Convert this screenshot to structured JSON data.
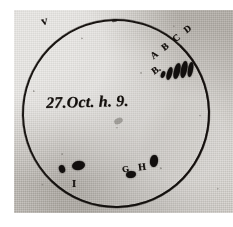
{
  "document": {
    "kind": "scanned-handwritten-sunspot-drawing",
    "paper_color": "#c9c6c0",
    "ink_color": "#15110e",
    "background_color": "#ffffff"
  },
  "disk": {
    "name": "solar-disk-circle",
    "stroke_color": "#1b1714"
  },
  "annotations": {
    "date": "27.Oct. h. 9.",
    "group_abcd": "A B C D",
    "label_b": "B.",
    "label_g": "G",
    "label_h": "H",
    "label_i": "I",
    "stray_mark": "v"
  },
  "spots": [
    {
      "id": "a",
      "group": "ABCD",
      "position": "upper-right"
    },
    {
      "id": "b",
      "group": "ABCD",
      "position": "upper-right"
    },
    {
      "id": "c",
      "group": "ABCD",
      "position": "upper-right"
    },
    {
      "id": "d",
      "group": "ABCD",
      "position": "upper-right"
    },
    {
      "id": "e",
      "group": "ABCD",
      "position": "upper-right"
    },
    {
      "id": "i1",
      "group": "I",
      "position": "lower-left"
    },
    {
      "id": "i2",
      "group": "I",
      "position": "lower-left"
    },
    {
      "id": "g",
      "group": "G",
      "position": "lower-center"
    },
    {
      "id": "h",
      "group": "H",
      "position": "lower-center"
    }
  ]
}
